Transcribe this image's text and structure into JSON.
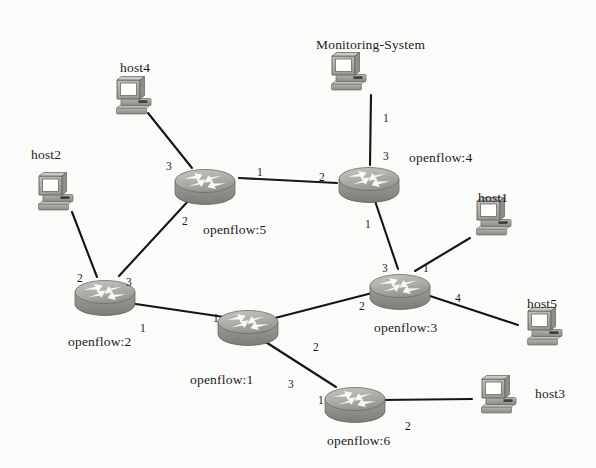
{
  "diagram": {
    "background_color": "#fbfbfa",
    "link_color": "#151515",
    "router_color": "#a9a9a4",
    "host_color": "#b0b0ac"
  },
  "routers": [
    {
      "id": "of1",
      "label": "openflow:1",
      "x": 248,
      "y": 322,
      "label_x": 190,
      "label_y": 372
    },
    {
      "id": "of2",
      "label": "openflow:2",
      "x": 105,
      "y": 292,
      "label_x": 68,
      "label_y": 334
    },
    {
      "id": "of3",
      "label": "openflow:3",
      "x": 400,
      "y": 286,
      "label_x": 374,
      "label_y": 320
    },
    {
      "id": "of4",
      "label": "openflow:4",
      "x": 369,
      "y": 179,
      "label_x": 409,
      "label_y": 150
    },
    {
      "id": "of5",
      "label": "openflow:5",
      "x": 205,
      "y": 181,
      "label_x": 203,
      "label_y": 222
    },
    {
      "id": "of6",
      "label": "openflow:6",
      "x": 355,
      "y": 399,
      "label_x": 327,
      "label_y": 433
    }
  ],
  "hosts": [
    {
      "id": "host1",
      "label": "host1",
      "x": 490,
      "y": 218,
      "label_x": 478,
      "label_y": 190
    },
    {
      "id": "host2",
      "label": "host2",
      "x": 52,
      "y": 193,
      "label_x": 31,
      "label_y": 147
    },
    {
      "id": "host3",
      "label": "host3",
      "x": 495,
      "y": 396,
      "label_x": 535,
      "label_y": 386
    },
    {
      "id": "host4",
      "label": "host4",
      "x": 130,
      "y": 97,
      "label_x": 120,
      "label_y": 60
    },
    {
      "id": "host5",
      "label": "host5",
      "x": 541,
      "y": 328,
      "label_x": 527,
      "label_y": 296
    },
    {
      "id": "monitoring",
      "label": "Monitoring-System",
      "x": 345,
      "y": 73,
      "label_x": 316,
      "label_y": 37
    }
  ],
  "links": [
    {
      "from": "host4",
      "to": "of5",
      "x1": 148,
      "y1": 113,
      "x2": 192,
      "y2": 168,
      "port_to": "3",
      "port_to_x": 166,
      "port_to_y": 160
    },
    {
      "from": "of5",
      "to": "of4",
      "x1": 239,
      "y1": 178,
      "x2": 337,
      "y2": 183,
      "port_from": "1",
      "port_from_x": 257,
      "port_from_y": 166,
      "port_to": "2",
      "port_to_x": 319,
      "port_to_y": 171
    },
    {
      "from": "monitoring",
      "to": "of4",
      "x1": 371,
      "y1": 95,
      "x2": 370,
      "y2": 165,
      "port_from": "1",
      "port_from_x": 383,
      "port_from_y": 112,
      "port_to": "3",
      "port_to_x": 383,
      "port_to_y": 150
    },
    {
      "from": "of4",
      "to": "of3",
      "x1": 374,
      "y1": 198,
      "x2": 398,
      "y2": 269,
      "port_from": "1",
      "port_from_x": 365,
      "port_from_y": 218,
      "port_to": "3",
      "port_to_x": 382,
      "port_to_y": 262
    },
    {
      "from": "host1",
      "to": "of3",
      "x1": 470,
      "y1": 238,
      "x2": 415,
      "y2": 271,
      "port_to": "1",
      "port_to_x": 423,
      "port_to_y": 262
    },
    {
      "from": "of3",
      "to": "host5",
      "x1": 427,
      "y1": 295,
      "x2": 518,
      "y2": 325,
      "port_from": "4",
      "port_from_x": 455,
      "port_from_y": 292
    },
    {
      "from": "host2",
      "to": "of2",
      "x1": 72,
      "y1": 212,
      "x2": 97,
      "y2": 277,
      "port_to": "2",
      "port_to_x": 77,
      "port_to_y": 272
    },
    {
      "from": "of2",
      "to": "of5",
      "x1": 119,
      "y1": 276,
      "x2": 190,
      "y2": 199,
      "port_from": "3",
      "port_from_x": 126,
      "port_from_y": 276,
      "port_to": "2",
      "port_to_x": 182,
      "port_to_y": 215
    },
    {
      "from": "of2",
      "to": "of1",
      "x1": 129,
      "y1": 303,
      "x2": 224,
      "y2": 317,
      "port_from": "1",
      "port_from_x": 140,
      "port_from_y": 322,
      "port_to": "1",
      "port_to_x": 213,
      "port_to_y": 312
    },
    {
      "from": "of1",
      "to": "of3",
      "x1": 275,
      "y1": 318,
      "x2": 376,
      "y2": 292,
      "port_from": "2",
      "port_from_x": 313,
      "port_from_y": 341,
      "port_to": "2",
      "port_to_x": 359,
      "port_to_y": 300
    },
    {
      "from": "of1",
      "to": "of6",
      "x1": 261,
      "y1": 339,
      "x2": 336,
      "y2": 387,
      "port_from": "3",
      "port_from_x": 288,
      "port_from_y": 378,
      "port_to": "1",
      "port_to_x": 318,
      "port_to_y": 394
    },
    {
      "from": "of6",
      "to": "host3",
      "x1": 382,
      "y1": 400,
      "x2": 472,
      "y2": 399,
      "port_from": "2",
      "port_from_x": 405,
      "port_from_y": 420
    }
  ]
}
